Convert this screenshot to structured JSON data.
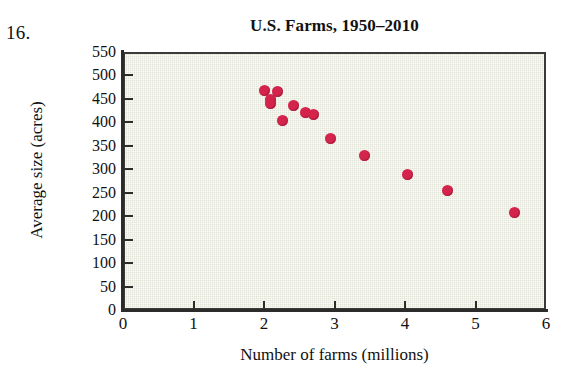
{
  "problem": {
    "number": "16."
  },
  "chart_data": {
    "type": "scatter",
    "title": "U.S. Farms, 1950–2010",
    "xlabel": "Number of farms (millions)",
    "ylabel": "Average size (acres)",
    "xlim": [
      0,
      6
    ],
    "ylim": [
      0,
      550
    ],
    "grid": false,
    "legend": null,
    "point_color": "#d4244c",
    "plot_background": "#e3e4d8",
    "xticks": [
      "0",
      "1",
      "2",
      "3",
      "4",
      "5",
      "6"
    ],
    "xtick_values": [
      0,
      1,
      2,
      3,
      4,
      5,
      6
    ],
    "yticks": [
      "0",
      "50",
      "100",
      "150",
      "200",
      "250",
      "300",
      "350",
      "400",
      "450",
      "500",
      "550"
    ],
    "ytick_values": [
      0,
      50,
      100,
      150,
      200,
      250,
      300,
      350,
      400,
      450,
      500,
      550
    ],
    "x": [
      1.98,
      2.16,
      2.06,
      2.06,
      2.23,
      2.39,
      2.56,
      2.67,
      2.92,
      3.4,
      4.0,
      4.58,
      5.53
    ],
    "y": [
      473,
      471,
      452,
      445,
      409,
      441,
      426,
      422,
      369,
      333,
      294,
      260,
      213
    ],
    "points": [
      {
        "x": 1.98,
        "y": 473
      },
      {
        "x": 2.16,
        "y": 471
      },
      {
        "x": 2.06,
        "y": 452
      },
      {
        "x": 2.06,
        "y": 445
      },
      {
        "x": 2.23,
        "y": 409
      },
      {
        "x": 2.39,
        "y": 441
      },
      {
        "x": 2.56,
        "y": 426
      },
      {
        "x": 2.67,
        "y": 422
      },
      {
        "x": 2.92,
        "y": 369
      },
      {
        "x": 3.4,
        "y": 333
      },
      {
        "x": 4.0,
        "y": 294
      },
      {
        "x": 4.58,
        "y": 260
      },
      {
        "x": 5.53,
        "y": 213
      }
    ]
  }
}
